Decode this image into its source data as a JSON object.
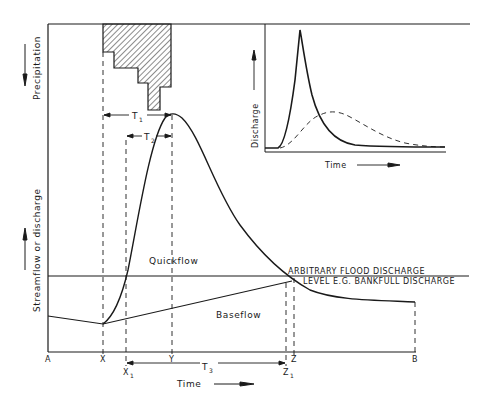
{
  "diagram": {
    "axes": {
      "precipitation_label": "Precipitation",
      "streamflow_label": "Streamflow or discharge",
      "time_label": "Time"
    },
    "x_markers": {
      "A": "A",
      "X": "X",
      "X1_main": "X",
      "X1_sub": "1",
      "Y": "Y",
      "Z": "Z",
      "Z1_main": "Z",
      "Z1_sub": "1",
      "B": "B"
    },
    "intervals": {
      "T1_main": "T",
      "T1_sub": "1",
      "T2_main": "T",
      "T2_sub": "2",
      "T3_main": "T",
      "T3_sub": "3"
    },
    "regions": {
      "quickflow": "Quickflow",
      "baseflow": "Baseflow"
    },
    "annotations": {
      "flood_line_1": "ARBITRARY FLOOD DISCHARGE",
      "flood_line_2": "LEVEL E.G. BANKFULL DISCHARGE"
    },
    "inset": {
      "ylabel": "Discharge",
      "xlabel": "Time",
      "series": [
        {
          "name": "flashy-hydrograph",
          "style": "solid"
        },
        {
          "name": "attenuated-hydrograph",
          "style": "dashed"
        }
      ]
    },
    "colors": {
      "ink": "#1a1a1a",
      "background": "#ffffff"
    }
  }
}
